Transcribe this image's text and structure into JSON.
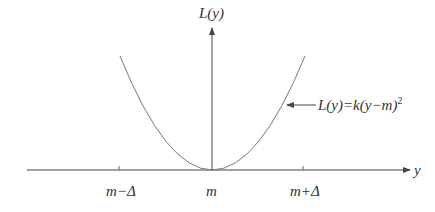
{
  "diagram": {
    "y_axis_label": "L(y)",
    "x_axis_label": "y",
    "curve_label": "L(y)=k(y−m)",
    "curve_label_exponent": "2",
    "ticks": [
      {
        "label": "m−Δ",
        "x": 119
      },
      {
        "label": "m",
        "x": 212
      },
      {
        "label": "m+Δ",
        "x": 303
      }
    ],
    "colors": {
      "axis": "#444444",
      "curve": "#777777",
      "text": "#333333"
    }
  }
}
